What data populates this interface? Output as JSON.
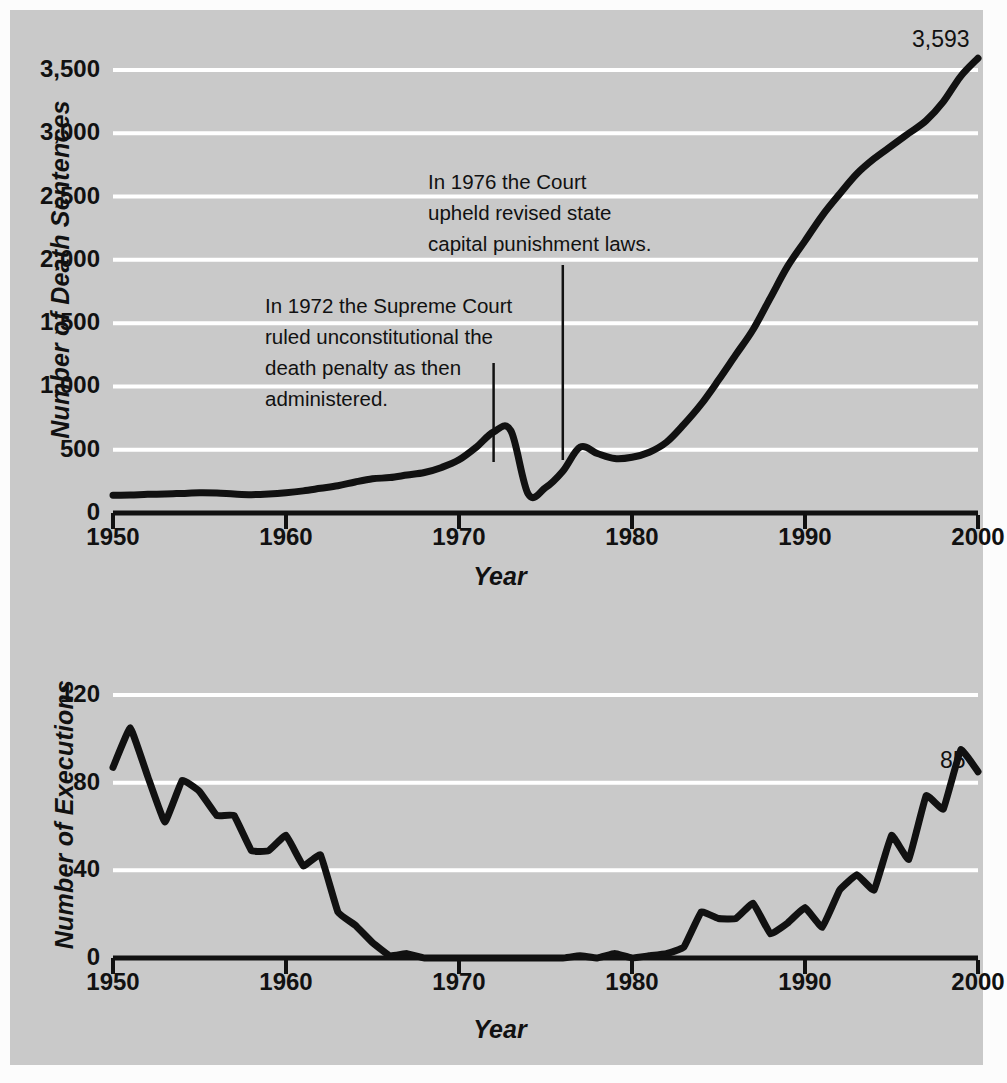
{
  "figure": {
    "background_color": "#c9c9c9",
    "line_color": "#111111",
    "gridline_color": "#ffffff"
  },
  "charts": {
    "top": {
      "ylabel": "Number of Death Sentences",
      "xlabel": "Year",
      "yticks": [
        "0",
        "500",
        "1,000",
        "1,500",
        "2,000",
        "2,500",
        "3,000",
        "3,500"
      ],
      "xticks": [
        "1950",
        "1960",
        "1970",
        "1980",
        "1990",
        "2000"
      ],
      "end_label": "3,593",
      "annotations": [
        {
          "id": "a1972",
          "text": "In 1972 the Supreme Court\nruled unconstitutional the\ndeath penalty as then\nadministered.",
          "year": 1972
        },
        {
          "id": "a1976",
          "text": "In 1976 the Court\nupheld revised state\ncapital punishment laws.",
          "year": 1976
        }
      ]
    },
    "bottom": {
      "ylabel": "Number of Executions",
      "xlabel": "Year",
      "yticks": [
        "0",
        "40",
        "80",
        "120"
      ],
      "xticks": [
        "1950",
        "1960",
        "1970",
        "1980",
        "1990",
        "2000"
      ],
      "end_label": "85"
    }
  },
  "chart_data": [
    {
      "type": "line",
      "id": "death-sentences",
      "title": "Number of Death Sentences",
      "xlabel": "Year",
      "ylabel": "Number of Death Sentences",
      "xlim": [
        1950,
        2000
      ],
      "ylim": [
        0,
        3700
      ],
      "yticks": [
        0,
        500,
        1000,
        1500,
        2000,
        2500,
        3000,
        3500
      ],
      "ytick_labels": [
        "0",
        "500",
        "1,000",
        "1,500",
        "2,000",
        "2,500",
        "3,000",
        "3,500"
      ],
      "xticks": [
        1950,
        1960,
        1970,
        1980,
        1990,
        2000
      ],
      "grid": "horizontal",
      "legend": "none",
      "annotations": [
        {
          "text": "In 1972 the Supreme Court ruled unconstitutional the death penalty as then administered.",
          "year": 1972
        },
        {
          "text": "In 1976 the Court upheld revised state capital punishment laws.",
          "year": 1976
        }
      ],
      "data_labels": [
        {
          "x": 2000,
          "y": 3593,
          "text": "3,593"
        }
      ],
      "x": [
        1950,
        1951,
        1952,
        1953,
        1954,
        1955,
        1956,
        1957,
        1958,
        1959,
        1960,
        1961,
        1962,
        1963,
        1964,
        1965,
        1966,
        1967,
        1968,
        1969,
        1970,
        1971,
        1972,
        1973,
        1974,
        1975,
        1976,
        1977,
        1978,
        1979,
        1980,
        1981,
        1982,
        1983,
        1984,
        1985,
        1986,
        1987,
        1988,
        1989,
        1990,
        1991,
        1992,
        1993,
        1994,
        1995,
        1996,
        1997,
        1998,
        1999,
        2000
      ],
      "y": [
        140,
        142,
        148,
        150,
        155,
        160,
        158,
        150,
        145,
        150,
        160,
        175,
        195,
        215,
        245,
        270,
        280,
        300,
        320,
        360,
        420,
        520,
        640,
        650,
        150,
        200,
        330,
        520,
        470,
        430,
        440,
        480,
        560,
        700,
        860,
        1050,
        1250,
        1450,
        1700,
        1950,
        2150,
        2350,
        2520,
        2680,
        2800,
        2900,
        3000,
        3100,
        3250,
        3450,
        3593
      ]
    },
    {
      "type": "line",
      "id": "executions",
      "title": "Number of Executions",
      "xlabel": "Year",
      "ylabel": "Number of Executions",
      "xlim": [
        1950,
        2000
      ],
      "ylim": [
        0,
        125
      ],
      "yticks": [
        0,
        40,
        80,
        120
      ],
      "ytick_labels": [
        "0",
        "40",
        "80",
        "120"
      ],
      "xticks": [
        1950,
        1960,
        1970,
        1980,
        1990,
        2000
      ],
      "grid": "horizontal",
      "legend": "none",
      "data_labels": [
        {
          "x": 1999,
          "y": 85,
          "text": "85"
        }
      ],
      "x": [
        1950,
        1951,
        1952,
        1953,
        1954,
        1955,
        1956,
        1957,
        1958,
        1959,
        1960,
        1961,
        1962,
        1963,
        1964,
        1965,
        1966,
        1967,
        1968,
        1969,
        1970,
        1971,
        1972,
        1973,
        1974,
        1975,
        1976,
        1977,
        1978,
        1979,
        1980,
        1981,
        1982,
        1983,
        1984,
        1985,
        1986,
        1987,
        1988,
        1989,
        1990,
        1991,
        1992,
        1993,
        1994,
        1995,
        1996,
        1997,
        1998,
        1999,
        2000
      ],
      "y": [
        87,
        105,
        83,
        62,
        81,
        76,
        65,
        65,
        49,
        49,
        56,
        42,
        47,
        21,
        15,
        7,
        1,
        2,
        0,
        0,
        0,
        0,
        0,
        0,
        0,
        0,
        0,
        1,
        0,
        2,
        0,
        1,
        2,
        5,
        21,
        18,
        18,
        25,
        11,
        16,
        23,
        14,
        31,
        38,
        31,
        56,
        45,
        74,
        68,
        95,
        85
      ]
    }
  ]
}
